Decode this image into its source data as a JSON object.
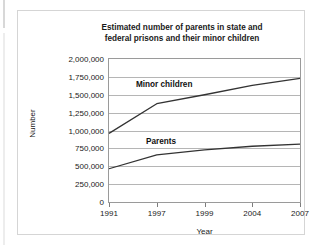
{
  "chart_data": {
    "type": "line",
    "title": "Estimated number of parents in state and federal prisons and their minor children",
    "title_line1": "Estimated number of parents in state and",
    "title_line2": "federal prisons and their minor children",
    "xlabel": "Year",
    "ylabel": "Number",
    "categories": [
      "1991",
      "1997",
      "1999",
      "2004",
      "2007"
    ],
    "ylim": [
      0,
      2000000
    ],
    "ytick_values": [
      0,
      250000,
      500000,
      750000,
      1000000,
      1250000,
      1500000,
      1750000,
      2000000
    ],
    "ytick_labels": [
      "0",
      "250,000",
      "500,000",
      "750,000",
      "1,000,000",
      "1,250,000",
      "1,500,000",
      "1,750,000",
      "2,000,000"
    ],
    "grid": true,
    "legend_position": "inline-annotation",
    "series": [
      {
        "name": "Minor children",
        "values": [
          960000,
          1375000,
          1500000,
          1630000,
          1730000
        ],
        "color": "#333333",
        "label_x": 118,
        "label_y": 69
      },
      {
        "name": "Parents",
        "values": [
          465000,
          660000,
          730000,
          780000,
          810000
        ],
        "color": "#333333",
        "label_x": 128,
        "label_y": 126
      }
    ]
  }
}
